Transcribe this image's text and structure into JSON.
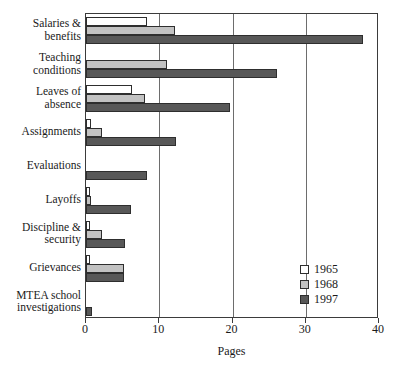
{
  "chart_data": {
    "type": "bar",
    "orientation": "horizontal",
    "title": "",
    "xlabel": "Pages",
    "ylabel": "",
    "xlim": [
      0,
      40
    ],
    "xticks": [
      0,
      10,
      20,
      30,
      40
    ],
    "xticklabels": [
      "0",
      "10",
      "20",
      "30",
      "40"
    ],
    "grid": "vertical",
    "legend_position": "lower-right",
    "categories": [
      "Salaries & benefits",
      "Teaching conditions",
      "Leaves of absence",
      "Assignments",
      "Evaluations",
      "Layoffs",
      "Discipline & security",
      "Grievances",
      "MTEA school investigations"
    ],
    "category_lines": [
      [
        "Salaries &",
        "benefits"
      ],
      [
        "Teaching",
        "conditions"
      ],
      [
        "Leaves of",
        "absence"
      ],
      [
        "Assignments"
      ],
      [
        "Evaluations"
      ],
      [
        "Layoffs"
      ],
      [
        "Discipline &",
        "security"
      ],
      [
        "Grievances"
      ],
      [
        "MTEA school",
        "investigations"
      ]
    ],
    "series": [
      {
        "name": "1965",
        "color": "#ffffff",
        "values": [
          8.3,
          0,
          6.3,
          0.7,
          0,
          0.6,
          0.5,
          0.5,
          0
        ]
      },
      {
        "name": "1968",
        "color": "#c2c2c2",
        "values": [
          12.2,
          11.1,
          8.1,
          2.2,
          0,
          0.7,
          2.2,
          5.2,
          0
        ]
      },
      {
        "name": "1997",
        "color": "#585858",
        "values": [
          37.8,
          26.1,
          19.6,
          12.3,
          8.3,
          6.2,
          5.3,
          5.2,
          0.8
        ]
      }
    ]
  }
}
